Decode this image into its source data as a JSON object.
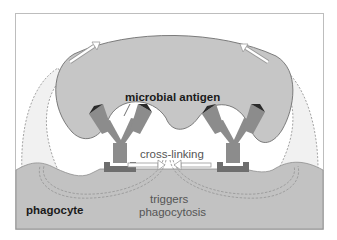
{
  "diagram": {
    "labels": {
      "antigen": "microbial antigen",
      "crosslinking": "cross-linking",
      "triggers_line1": "triggers",
      "triggers_line2": "phagocytosis",
      "phagocyte": "phagocyte"
    },
    "components": [
      {
        "id": "microbe",
        "label": "microbial antigen",
        "shape": "lobed blob"
      },
      {
        "id": "antibody-left",
        "label": "antibody (IgG)"
      },
      {
        "id": "antibody-right",
        "label": "antibody (IgG)"
      },
      {
        "id": "fc-receptor-left",
        "label": "Fc receptor"
      },
      {
        "id": "fc-receptor-right",
        "label": "Fc receptor"
      },
      {
        "id": "phagocyte",
        "label": "phagocyte"
      },
      {
        "id": "pseudopod-left",
        "label": "pseudopod (dashed outline)"
      },
      {
        "id": "pseudopod-right",
        "label": "pseudopod (dashed outline)"
      }
    ],
    "arrows": [
      {
        "from": "left side",
        "to": "top of microbe",
        "style": "open outline",
        "meaning": "engulfment"
      },
      {
        "from": "right side",
        "to": "top of microbe",
        "style": "open outline",
        "meaning": "engulfment"
      },
      {
        "from": "left receptor",
        "to": "center",
        "style": "open outline",
        "meaning": "cross-linking"
      },
      {
        "from": "right receptor",
        "to": "center",
        "style": "open outline",
        "meaning": "cross-linking"
      },
      {
        "from": "center",
        "to": "pseudopods",
        "style": "dashed",
        "meaning": "triggers phagocytosis"
      }
    ],
    "colors": {
      "frame": "#bdbdbd",
      "microbe_fill": "#c6c6c6",
      "microbe_stroke": "#7a7a7a",
      "phagocyte_fill": "#c2c2c2",
      "antibody": "#8c8c8c",
      "receptor": "#6e6e6e",
      "antigen_tip": "#2a2a2a",
      "pseudopod_fill": "#f0f0f0",
      "dash": "#9a9a9a"
    }
  }
}
